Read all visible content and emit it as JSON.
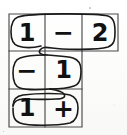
{
  "image": {
    "title": "Handwritten L-shaped number grid with snake path",
    "width": 127,
    "height": 135,
    "background_color": "#fdfdfc",
    "ink_color": "#111111",
    "grid_line_color": "#4a4a4a",
    "path_color": "#1a1a1a"
  },
  "grid": {
    "shape": "L-shaped",
    "columns": 3,
    "rows": 3,
    "left": 9,
    "top": 14,
    "cell_width": 36,
    "cell_height": 37,
    "rows_data": [
      {
        "row_index": 1,
        "cells": [
          {
            "col": 1,
            "value": "1",
            "kind": "digit"
          },
          {
            "col": 2,
            "value": "−",
            "kind": "operator"
          },
          {
            "col": 3,
            "value": "2",
            "kind": "digit"
          }
        ]
      },
      {
        "row_index": 2,
        "cells": [
          {
            "col": 1,
            "value": "−",
            "kind": "operator"
          },
          {
            "col": 2,
            "value": "1",
            "kind": "digit"
          }
        ]
      },
      {
        "row_index": 3,
        "cells": [
          {
            "col": 1,
            "value": "1",
            "kind": "digit"
          },
          {
            "col": 2,
            "value": "+",
            "kind": "operator"
          }
        ]
      }
    ]
  },
  "path": {
    "name": "snake-path",
    "description": "Continuous hand-drawn looping line threading through every cell of the grid",
    "stroke_width": 1.6,
    "segments": [
      "row1-capsule-loop",
      "row1-to-row2-hook",
      "row2-capsule-loop",
      "row2-to-row3-hook",
      "row3-capsule-loop"
    ]
  },
  "marks": [
    {
      "name": "scan-speck-top",
      "x": 89,
      "y": 7,
      "size": 2
    },
    {
      "name": "scan-speck-edge",
      "x": 3,
      "y": 131,
      "size": 1
    }
  ]
}
